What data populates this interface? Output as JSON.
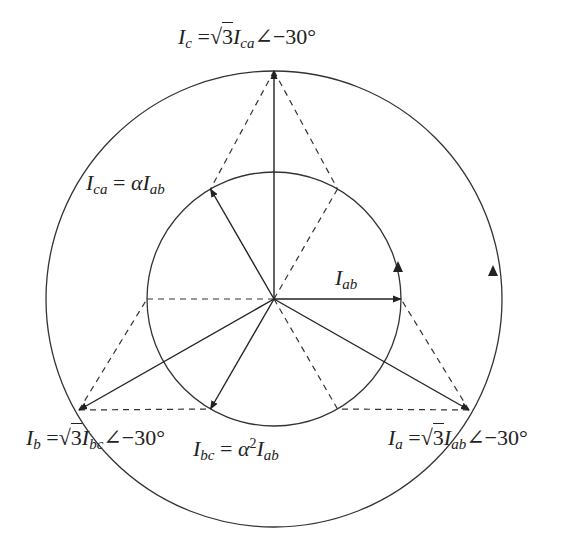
{
  "diagram": {
    "type": "phasor-diagram",
    "center": [
      274,
      299
    ],
    "outer_circle_radius": 228,
    "inner_circle_radius": 127,
    "stroke_color": "#333333",
    "phasors": [
      {
        "id": "Iab",
        "label": "I_ab",
        "angle_deg": 0,
        "circle": "inner"
      },
      {
        "id": "Ica",
        "label": "I_ca = αI_ab",
        "angle_deg": 120,
        "circle": "inner"
      },
      {
        "id": "Ibc",
        "label": "I_bc = α²I_ab",
        "angle_deg": 240,
        "circle": "inner"
      },
      {
        "id": "Ic",
        "label": "I_c = √3 I_ca ∠−30°",
        "angle_deg": 90,
        "circle": "outer"
      },
      {
        "id": "Ia",
        "label": "I_a = √3 I_ab ∠−30°",
        "angle_deg": -30,
        "circle": "outer"
      },
      {
        "id": "Ib",
        "label": "I_b = √3 I_bc ∠−30°",
        "angle_deg": 210,
        "circle": "outer"
      }
    ],
    "rotation_direction": "counter-clockwise"
  },
  "labels": {
    "ic": {
      "main": "I",
      "sub": "c",
      "eq": " =",
      "root": "√",
      "three": "3",
      "var": "I",
      "var_sub": "ca",
      "angle": "∠−30°"
    },
    "ica": {
      "main": "I",
      "sub": "ca",
      "eq": " = ",
      "coef": "α",
      "var": "I",
      "var_sub": "ab"
    },
    "iab": {
      "main": "I",
      "sub": "ab"
    },
    "ib": {
      "main": "I",
      "sub": "b",
      "eq": " =",
      "root": "√",
      "three": "3",
      "var": "I",
      "var_sub": "bc",
      "angle": "∠−30°"
    },
    "ibc": {
      "main": "I",
      "sub": "bc",
      "eq": " = ",
      "coef": "α",
      "sup": "2",
      "var": "I",
      "var_sub": "ab"
    },
    "ia": {
      "main": "I",
      "sub": "a",
      "eq": " =",
      "root": "√",
      "three": "3",
      "var": "I",
      "var_sub": "ab",
      "angle": "∠−30°"
    }
  }
}
